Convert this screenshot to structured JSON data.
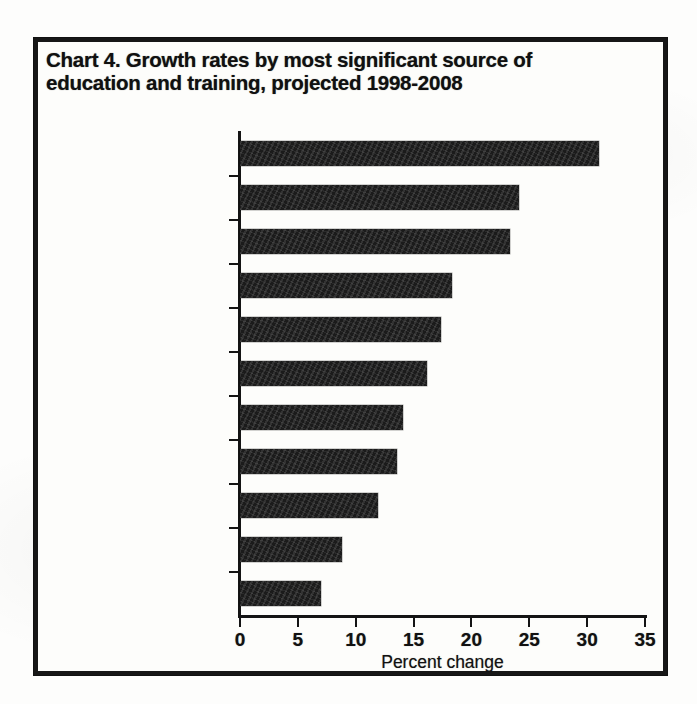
{
  "figure": {
    "title": "Chart 4. Growth rates by most significant source of education and training, projected 1998-2008",
    "title_line1": "Chart 4. Growth rates by most significant source of",
    "title_line2": "education and training, projected 1998-2008"
  },
  "chart_data": {
    "type": "bar",
    "orientation": "horizontal",
    "title": "Chart 4. Growth rates by most significant source of education and training, projected 1998-2008",
    "xlabel": "Percent change",
    "ylabel": "",
    "xlim": [
      0,
      35
    ],
    "xticks": [
      0,
      5,
      10,
      15,
      20,
      25,
      30,
      35
    ],
    "xtick_labels": [
      "0",
      "5",
      "10",
      "15",
      "20",
      "25",
      "30",
      "35"
    ],
    "grid": false,
    "legend": null,
    "bar_color": "#1b1b1b",
    "categories": [
      "Associate degree",
      "Bachelor's degree",
      "Doctoral degree",
      "Master's degree",
      "Work experience plus bachelor's degree or higher",
      "First professional degree",
      "Postsecondary vocational training",
      "Short-term on-the-job training",
      "Work experience in a related occupation",
      "Long-term on-the-job training",
      "Moderate-term on-the-job training"
    ],
    "category_lines": [
      [
        "Associate degree"
      ],
      [
        "Bachelor's degree"
      ],
      [
        "Doctoral degree"
      ],
      [
        "Master's degree"
      ],
      [
        "Work experience plus bachelor's",
        "degree or higher"
      ],
      [
        "First professional degree"
      ],
      [
        "Postsecondary vocational training"
      ],
      [
        "Short-term on-the-job training"
      ],
      [
        "Work experience in a related",
        "occupation"
      ],
      [
        "Long-term on-the-job training"
      ],
      [
        "Moderate-term on-the-job training"
      ]
    ],
    "values": [
      31.0,
      24.1,
      23.3,
      18.3,
      17.4,
      16.2,
      14.1,
      13.6,
      11.9,
      8.8,
      7.0
    ]
  }
}
